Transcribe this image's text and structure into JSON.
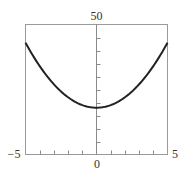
{
  "chart_data": {
    "type": "line",
    "title": "",
    "xlabel": "",
    "ylabel": "",
    "xlim": [
      -5,
      5
    ],
    "ylim": [
      0,
      50
    ],
    "grid": false,
    "legend": null,
    "function_estimate": "y = x^2 + 18",
    "x_tick_labels": [
      "-5",
      "0",
      "5"
    ],
    "y_tick_labels": [
      "50"
    ],
    "x_minor_ticks": [
      -4,
      -3,
      -2,
      -1,
      1,
      2,
      3,
      4
    ],
    "y_minor_ticks": [
      5,
      10,
      15,
      20,
      25,
      30,
      35,
      40,
      45
    ],
    "series": [
      {
        "name": "curve",
        "color": "#222222",
        "x": [
          -5,
          -4,
          -3,
          -2,
          -1,
          0,
          1,
          2,
          3,
          4,
          5
        ],
        "y": [
          43,
          34,
          27,
          22,
          19,
          18,
          19,
          22,
          27,
          34,
          43
        ]
      }
    ]
  },
  "labels": {
    "x_min": "−5",
    "x_zero": "0",
    "x_max": "5",
    "y_max": "50"
  },
  "colors": {
    "frame": "#9a9a9a",
    "axis": "#8a8a8a",
    "curve": "#222222",
    "text": "#333333"
  }
}
